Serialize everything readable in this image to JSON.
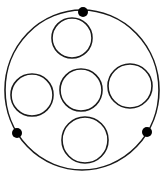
{
  "diagram": {
    "background": "#ffffff",
    "stroke": "#1a1a1a",
    "outer_circle": {
      "cx": 82,
      "cy": 90,
      "rx": 77,
      "ry": 80,
      "stroke_width": 1.6
    },
    "inner_circles": [
      {
        "name": "top",
        "cx": 72,
        "cy": 38,
        "r": 20
      },
      {
        "name": "left",
        "cx": 32,
        "cy": 95,
        "r": 21
      },
      {
        "name": "center",
        "cx": 81,
        "cy": 90,
        "r": 21
      },
      {
        "name": "right",
        "cx": 130,
        "cy": 86,
        "r": 22
      },
      {
        "name": "bottom",
        "cx": 85,
        "cy": 140,
        "r": 23
      }
    ],
    "dots": [
      {
        "name": "top",
        "cx": 83,
        "cy": 12,
        "r": 5
      },
      {
        "name": "left",
        "cx": 17,
        "cy": 133,
        "r": 5
      },
      {
        "name": "right",
        "cx": 147,
        "cy": 132,
        "r": 5
      }
    ]
  }
}
